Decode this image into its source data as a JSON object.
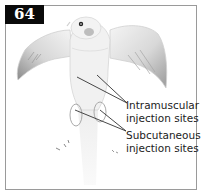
{
  "figure": {
    "number": "64",
    "labels": {
      "intramuscular": {
        "line1": "Intramuscular",
        "line2": "injection sites"
      },
      "subcutaneous": {
        "line1": "Subcutaneous",
        "line2": "injection sites"
      }
    },
    "colors": {
      "badge_bg": "#0a0a0a",
      "badge_text": "#ffffff",
      "outline": "#c8c8c8",
      "leader_line": "#333333",
      "frame": "#9a9a9a"
    }
  }
}
